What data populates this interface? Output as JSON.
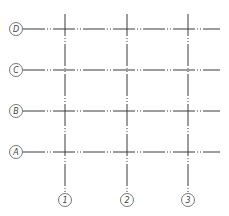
{
  "diagram": {
    "type": "structural-grid",
    "colors": {
      "line": "#3a3a3a",
      "bubble_stroke": "#555555",
      "label": "#444444",
      "background": "#ffffff"
    },
    "rows": [
      {
        "label": "D",
        "y": 29
      },
      {
        "label": "C",
        "y": 70
      },
      {
        "label": "B",
        "y": 111
      },
      {
        "label": "A",
        "y": 152
      }
    ],
    "columns": [
      {
        "label": "1",
        "x": 65
      },
      {
        "label": "2",
        "x": 127
      },
      {
        "label": "3",
        "x": 188
      }
    ],
    "row_bubble_x": 16,
    "column_bubble_y": 200,
    "bubble_radius": 6.5
  }
}
